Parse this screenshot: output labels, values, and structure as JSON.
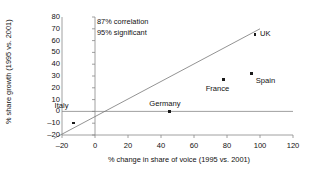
{
  "chart_data": {
    "type": "scatter",
    "title": "",
    "xlabel": "% change in share of voice (1995 vs. 2001)",
    "ylabel": "% share growth (1995 vs. 2001)",
    "xlim": [
      -20,
      120
    ],
    "ylim": [
      -20,
      80
    ],
    "xticks": [
      -20,
      0,
      20,
      40,
      60,
      80,
      100,
      120
    ],
    "yticks": [
      -20,
      -10,
      0,
      10,
      20,
      30,
      40,
      50,
      60,
      70,
      80
    ],
    "xtick_labels": [
      "–20",
      "0",
      "20",
      "40",
      "60",
      "80",
      "100",
      "120"
    ],
    "ytick_labels": [
      "80",
      "70",
      "60",
      "50",
      "40",
      "30",
      "20",
      "10",
      "0",
      "–10",
      "–20"
    ],
    "grid": false,
    "legend": false,
    "points": [
      {
        "label": "Italy",
        "x": -13,
        "y": -10,
        "label_dx": -19,
        "label_dy": -21
      },
      {
        "label": "Germany",
        "x": 45,
        "y": 0,
        "label_dx": -20,
        "label_dy": -11
      },
      {
        "label": "France",
        "x": 78,
        "y": 27,
        "label_dx": -18,
        "label_dy": 5
      },
      {
        "label": "Spain",
        "x": 95,
        "y": 32,
        "label_dx": 4,
        "label_dy": 3
      },
      {
        "label": "UK",
        "x": 97,
        "y": 65,
        "label_dx": 5,
        "label_dy": -5
      }
    ],
    "trendline": {
      "x0": -25,
      "y0": -23,
      "x1": 100,
      "y1": 70
    },
    "annotations": [
      "87% correlation",
      "95% significant"
    ],
    "colors": {
      "point": "#1a1a1a",
      "axis": "#888888",
      "trendline": "#777777",
      "text": "#111111",
      "background": "#ffffff"
    }
  }
}
